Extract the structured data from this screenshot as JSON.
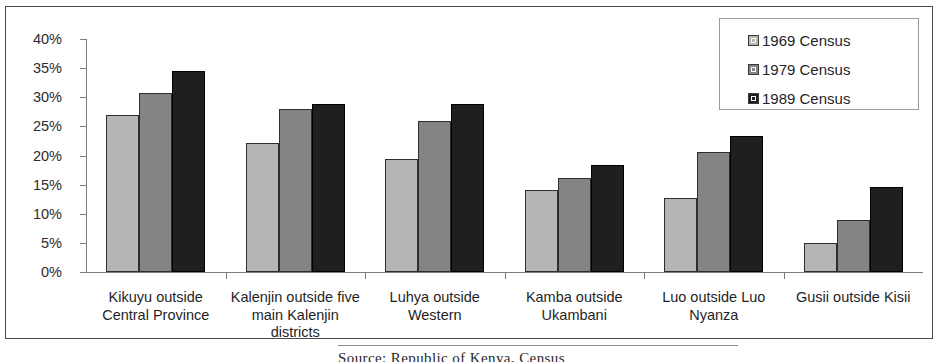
{
  "chart_data": {
    "type": "bar",
    "title": "",
    "xlabel": "",
    "ylabel": "",
    "ylim": [
      0,
      40
    ],
    "ytick_labels": [
      "0%",
      "5%",
      "10%",
      "15%",
      "20%",
      "25%",
      "30%",
      "35%",
      "40%"
    ],
    "ytick_values": [
      0,
      5,
      10,
      15,
      20,
      25,
      30,
      35,
      40
    ],
    "grid": false,
    "legend_position": "top-right",
    "categories": [
      "Kikuyu outside Central Province",
      "Kalenjin outside five main Kalenjin districts",
      "Luhya outside Western",
      "Kamba outside Ukambani",
      "Luo outside Luo Nyanza",
      "Gusii outside Kisii"
    ],
    "category_lines": [
      [
        "Kikuyu outside",
        "Central Province"
      ],
      [
        "Kalenjin outside five",
        "main Kalenjin",
        "districts"
      ],
      [
        "Luhya outside",
        "Western"
      ],
      [
        "Kamba outside",
        "Ukambani"
      ],
      [
        "Luo outside Luo",
        "Nyanza"
      ],
      [
        "Gusii outside Kisii"
      ]
    ],
    "series": [
      {
        "name": "1969 Census",
        "color": "#b5b5b5",
        "values": [
          27.0,
          22.2,
          19.4,
          14.1,
          12.7,
          5.0
        ]
      },
      {
        "name": "1979 Census",
        "color": "#848484",
        "values": [
          30.8,
          27.9,
          25.9,
          16.2,
          20.6,
          9.0
        ]
      },
      {
        "name": "1989 Census",
        "color": "#1f1f1f",
        "values": [
          34.5,
          28.8,
          28.8,
          18.3,
          23.4,
          14.6
        ]
      }
    ]
  },
  "legend": {
    "entries": [
      "1969 Census",
      "1979 Census",
      "1989 Census"
    ]
  },
  "caption": {
    "text": "Source: Republic of Kenya, Census"
  }
}
